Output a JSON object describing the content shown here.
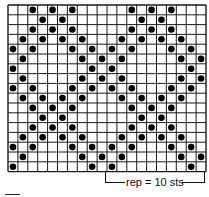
{
  "chart_data": {
    "type": "knitting-chart",
    "columns": 20,
    "rows": 17,
    "cell_symbol": "dot",
    "dots_by_row_from_top": [
      [
        2,
        4,
        6,
        12,
        14,
        16
      ],
      [
        3,
        5,
        13,
        15
      ],
      [
        2,
        4,
        6,
        12,
        14,
        16
      ],
      [
        1,
        3,
        5,
        7,
        11,
        13,
        15,
        17
      ],
      [
        0,
        2,
        6,
        8,
        10,
        12,
        16,
        18
      ],
      [
        1,
        7,
        9,
        11,
        17,
        19
      ],
      [
        0,
        8,
        10,
        18
      ],
      [
        1,
        7,
        9,
        11,
        17,
        19
      ],
      [
        0,
        2,
        6,
        8,
        10,
        12,
        16,
        18
      ],
      [
        1,
        3,
        5,
        7,
        11,
        13,
        15,
        17
      ],
      [
        2,
        4,
        6,
        12,
        14,
        16
      ],
      [
        3,
        5,
        13,
        15
      ],
      [
        2,
        4,
        6,
        12,
        14,
        16
      ],
      [
        1,
        3,
        5,
        7,
        11,
        13,
        15,
        17
      ],
      [
        0,
        2,
        6,
        8,
        10,
        12,
        16,
        18
      ],
      [
        1,
        7,
        9,
        11,
        17,
        19
      ],
      [
        0,
        8,
        10,
        18
      ]
    ],
    "repeat": {
      "label": "rep = 10 sts",
      "stitches": 10,
      "start_col": 10,
      "end_col": 19
    }
  },
  "colors": {
    "grid": "#1a1a1a",
    "dot": "#000000",
    "background": "#ffffff"
  },
  "labels": {
    "repeat": "rep = 10 sts"
  }
}
